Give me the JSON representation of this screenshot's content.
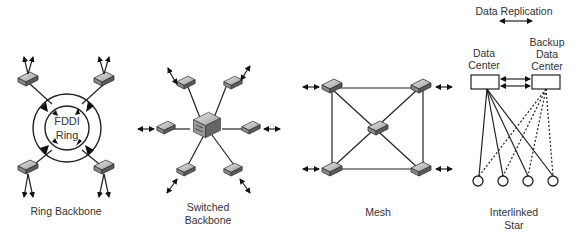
{
  "diagram": {
    "topologies": [
      {
        "id": "ring",
        "label": "Ring Backbone",
        "center_label": [
          "FDDI",
          "Ring"
        ],
        "node_count": 4
      },
      {
        "id": "switched",
        "label": [
          "Switched",
          "Backbone"
        ],
        "node_count": 6,
        "hub": "switch"
      },
      {
        "id": "mesh",
        "label": "Mesh",
        "node_count": 5
      },
      {
        "id": "interlinked",
        "label": [
          "Interlinked",
          "Star"
        ],
        "node_count": 4,
        "primary": [
          "Data",
          "Center"
        ],
        "backup": [
          "Backup",
          "Data",
          "Center"
        ],
        "replication_label": "Data Replication"
      }
    ]
  }
}
